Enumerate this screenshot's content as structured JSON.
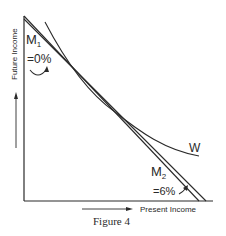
{
  "figure": {
    "caption": "Figure 4",
    "axes": {
      "x_label": "Present Income",
      "y_label": "Future Income"
    },
    "lines": [
      {
        "name": "M",
        "subscript": "1",
        "rate": "=0%"
      },
      {
        "name": "M",
        "subscript": "2",
        "rate": "=6%"
      }
    ],
    "curve": {
      "label": "W"
    },
    "colors": {
      "ink": "#2a2a2a",
      "background": "#ffffff"
    }
  }
}
